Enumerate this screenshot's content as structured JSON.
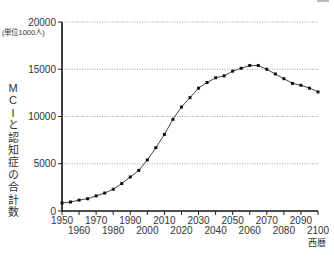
{
  "chart_data": {
    "type": "line",
    "title": "",
    "xlabel": "西暦",
    "ylabel": "MCIと認知症の合計数",
    "yunit": "(単位1000人)",
    "ylim": [
      0,
      20000
    ],
    "xlim": [
      1950,
      2100
    ],
    "yticks": [
      0,
      5000,
      10000,
      15000,
      20000
    ],
    "xticks_upper": [
      "1950",
      "1970",
      "1990",
      "2010",
      "2030",
      "2050",
      "2070",
      "2090"
    ],
    "xticks_lower": [
      "1960",
      "1980",
      "2000",
      "2020",
      "2040",
      "2060",
      "2080",
      "2100"
    ],
    "grid": "horizontal dotted",
    "legend": "none",
    "x": [
      1950,
      1955,
      1960,
      1965,
      1970,
      1975,
      1980,
      1985,
      1990,
      1995,
      2000,
      2005,
      2010,
      2015,
      2020,
      2025,
      2030,
      2035,
      2040,
      2045,
      2050,
      2055,
      2060,
      2065,
      2070,
      2075,
      2080,
      2085,
      2090,
      2095,
      2100
    ],
    "series": [
      {
        "name": "MCIと認知症の合計数",
        "values": [
          850,
          950,
          1150,
          1300,
          1600,
          1900,
          2300,
          2900,
          3600,
          4300,
          5400,
          6700,
          8100,
          9700,
          11000,
          12000,
          13000,
          13600,
          14100,
          14300,
          14800,
          15100,
          15400,
          15400,
          15000,
          14500,
          14000,
          13500,
          13300,
          13000,
          12600
        ]
      }
    ]
  },
  "labels": {
    "ylabel_chars": [
      "M",
      "C",
      "I",
      "と",
      "認",
      "知",
      "症",
      "の",
      "合",
      "計",
      "数"
    ],
    "yunit": "(単位1000人)",
    "xunit": "西暦"
  }
}
